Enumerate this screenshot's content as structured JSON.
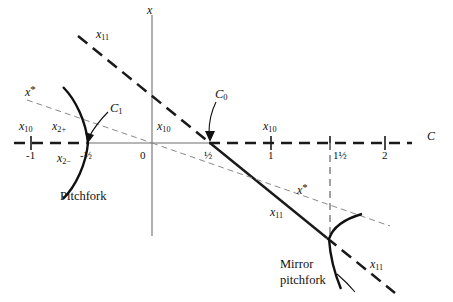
{
  "figure": {
    "type": "bifurcation-diagram",
    "background_color": "#ffffff",
    "ink_color": "#111111",
    "axis_color": "#6e6e6e",
    "thin_dash_color": "#8a8a8a"
  },
  "axes": {
    "horizontal_label": "C",
    "vertical_label": "x",
    "origin_label": "0",
    "ticks": [
      {
        "label": "-1",
        "value": -1
      },
      {
        "label": "-½",
        "value": -0.5
      },
      {
        "label": "0",
        "value": 0
      },
      {
        "label": "½",
        "value": 0.5
      },
      {
        "label": "1",
        "value": 1
      },
      {
        "label": "1½",
        "value": 1.5
      },
      {
        "label": "2",
        "value": 2
      }
    ]
  },
  "branch_labels": {
    "x10_left": {
      "base": "x",
      "sub": "10"
    },
    "x10_center": {
      "base": "x",
      "sub": "10"
    },
    "x10_right": {
      "base": "x",
      "sub": "10"
    },
    "x11_upper": {
      "base": "x",
      "sub": "11"
    },
    "x11_lower": {
      "base": "x",
      "sub": "11"
    },
    "x11_mirror": {
      "base": "x",
      "sub": "11"
    },
    "x2_plus": {
      "base": "x",
      "sub": "2+"
    },
    "x2_minus": {
      "base": "x",
      "sub": "2−"
    },
    "xstar_upper": {
      "base": "x",
      "sup": "*"
    },
    "xstar_lower": {
      "base": "x",
      "sup": "*"
    }
  },
  "critical_points": {
    "C1": {
      "base": "C",
      "sub": "1",
      "value": -0.5
    },
    "C0": {
      "base": "C",
      "sub": "0",
      "value": 0.5
    }
  },
  "captions": {
    "pitchfork": "Pitchfork",
    "mirror_pitchfork_line1": "Mirror",
    "mirror_pitchfork_line2": "pitchfork"
  }
}
